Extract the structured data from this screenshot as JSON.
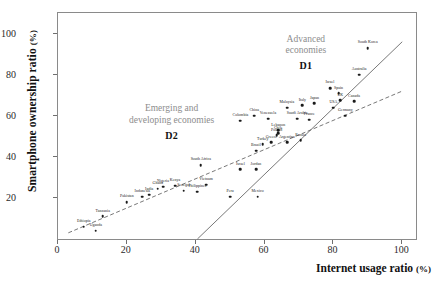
{
  "chart_data": {
    "type": "scatter",
    "title": "",
    "xlabel": "Internet usage ratio",
    "xunit": "(%)",
    "ylabel": "Smartphone ownership ratio",
    "yunit": "(%)",
    "xlim": [
      0,
      104
    ],
    "ylim": [
      0,
      110
    ],
    "xticks": [
      0,
      20,
      40,
      60,
      80,
      100
    ],
    "yticks": [
      20,
      40,
      60,
      80,
      100
    ],
    "grid": false,
    "legend_position": "in-plot-annotations",
    "annotations": [
      {
        "text_line1": "Advanced",
        "text_line2": "economies",
        "code": "D1",
        "x": 72,
        "y": 100
      },
      {
        "text_line1": "Emerging and",
        "text_line2": "developing economies",
        "code": "D2",
        "x": 33,
        "y": 66
      }
    ],
    "series": [
      {
        "name": "D1",
        "label": "Advanced economies",
        "fit": "solid",
        "fit_line": {
          "x1": 40.5,
          "y1": 0,
          "x2": 100,
          "y2": 96
        },
        "points": [
          {
            "label": "South Korea",
            "x": 90.0,
            "y": 93.0
          },
          {
            "label": "Australia",
            "x": 87.5,
            "y": 80.0
          },
          {
            "label": "Israel",
            "x": 79.0,
            "y": 73.5
          },
          {
            "label": "Spain",
            "x": 81.5,
            "y": 71.0
          },
          {
            "label": "UK",
            "x": 82.0,
            "y": 67.5
          },
          {
            "label": "Canada",
            "x": 86.0,
            "y": 67.0
          },
          {
            "label": "Japan",
            "x": 74.5,
            "y": 66.0
          },
          {
            "label": "Germany",
            "x": 83.5,
            "y": 60.0
          },
          {
            "label": "Italy",
            "x": 71.0,
            "y": 65.0
          },
          {
            "label": "USA",
            "x": 80.0,
            "y": 64.0
          },
          {
            "label": "France",
            "x": 73.0,
            "y": 58.0
          },
          {
            "label": "Poland",
            "x": 63.5,
            "y": 50.5
          },
          {
            "label": "Greece",
            "x": 62.0,
            "y": 47.0
          }
        ]
      },
      {
        "name": "D2",
        "label": "Emerging and developing economies",
        "fit": "dashed",
        "fit_line": {
          "x1": 3.0,
          "y1": 3.0,
          "x2": 100,
          "y2": 72
        },
        "points": [
          {
            "label": "Ethiopia",
            "x": 7.5,
            "y": 6.0
          },
          {
            "label": "Uganda",
            "x": 11.0,
            "y": 4.0
          },
          {
            "label": "Tanzania",
            "x": 13.0,
            "y": 11.0
          },
          {
            "label": "Pakistan",
            "x": 20.0,
            "y": 18.0
          },
          {
            "label": "Indonesia",
            "x": 24.5,
            "y": 20.5
          },
          {
            "label": "India",
            "x": 26.5,
            "y": 21.5
          },
          {
            "label": "Ghana",
            "x": 29.0,
            "y": 24.5
          },
          {
            "label": "Nigeria",
            "x": 30.5,
            "y": 25.5
          },
          {
            "label": "Kenya",
            "x": 34.0,
            "y": 26.0
          },
          {
            "label": "Senegal",
            "x": 36.5,
            "y": 23.5
          },
          {
            "label": "Philippines",
            "x": 40.5,
            "y": 23.0
          },
          {
            "label": "Vietnam",
            "x": 43.0,
            "y": 26.5
          },
          {
            "label": "South Africa",
            "x": 41.5,
            "y": 36.0
          },
          {
            "label": "Peru",
            "x": 50.0,
            "y": 20.5
          },
          {
            "label": "Mexico",
            "x": 58.0,
            "y": 20.5
          },
          {
            "label": "Israel B",
            "x": 53.0,
            "y": 34.0
          },
          {
            "label": "Jordan",
            "x": 57.5,
            "y": 34.0
          },
          {
            "label": "Brazil",
            "x": 57.5,
            "y": 43.0
          },
          {
            "label": "Lebanon",
            "x": 64.0,
            "y": 53.0
          },
          {
            "label": "Turkey",
            "x": 59.5,
            "y": 46.0
          },
          {
            "label": "Chile",
            "x": 64.0,
            "y": 51.5
          },
          {
            "label": "Argentina",
            "x": 66.5,
            "y": 47.0
          },
          {
            "label": "Russia",
            "x": 70.5,
            "y": 48.0
          },
          {
            "label": "China",
            "x": 57.0,
            "y": 60.0
          },
          {
            "label": "Malaysia",
            "x": 66.5,
            "y": 64.0
          },
          {
            "label": "Saudi Arabia",
            "x": 69.5,
            "y": 58.5
          },
          {
            "label": "Venezuela",
            "x": 61.0,
            "y": 58.5
          },
          {
            "label": "Colombia",
            "x": 53.0,
            "y": 57.5
          }
        ]
      }
    ]
  }
}
